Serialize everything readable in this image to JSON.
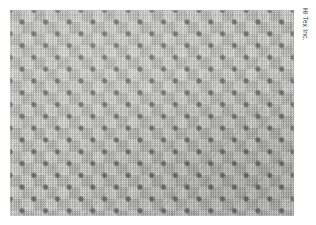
{
  "image": {
    "kind": "fabric-swatch-photo",
    "width_px": 316,
    "height_px": 225,
    "background_color": "#ffffff"
  },
  "swatch": {
    "name": "woven fabric swatch",
    "left_px": 10,
    "top_px": 10,
    "width_px": 284,
    "height_px": 206,
    "weave_type": "basket / checkerboard weave",
    "block_size_px": 11.8,
    "repeat_size_px": 23.6,
    "blocks_across": 24,
    "blocks_down": 17,
    "colors": {
      "light_block": "#cdcdc9",
      "mid_block": "#adada9",
      "ground": "#c2c2be",
      "intersection_node": "#6a6a6a"
    }
  },
  "caption": {
    "text": "Hi Tex Inc.",
    "rotation_deg": 90,
    "color": "#343434",
    "position": "right-edge-top"
  }
}
